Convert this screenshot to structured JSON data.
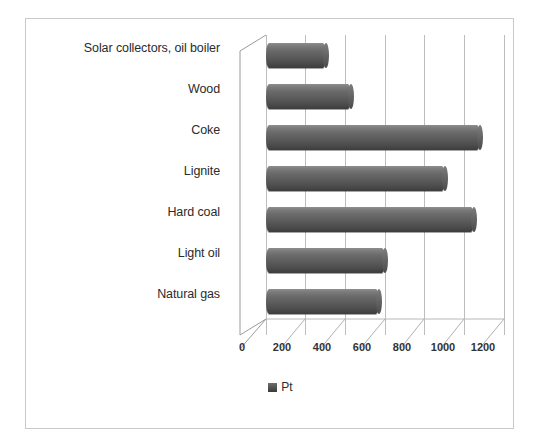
{
  "chart_data": {
    "type": "bar",
    "orientation": "horizontal",
    "style": "3d-cylinder",
    "title": "",
    "xlabel": "",
    "ylabel": "",
    "categories": [
      "Solar collectors, oil boiler",
      "Wood",
      "Coke",
      "Lignite",
      "Hard coal",
      "Light oil",
      "Natural gas"
    ],
    "series": [
      {
        "name": "Pt",
        "values": [
          300,
          430,
          1080,
          900,
          1050,
          600,
          570
        ],
        "color": "#5c5c5c"
      }
    ],
    "xlim": [
      0,
      1200
    ],
    "xticks": [
      0,
      200,
      400,
      600,
      800,
      1000,
      1200
    ],
    "xtick_labels": [
      "0",
      "200",
      "400",
      "600",
      "800",
      "1000",
      "1200"
    ],
    "grid": true,
    "grid_axis": "x",
    "legend": {
      "position": "bottom",
      "entries": [
        {
          "label": "Pt",
          "marker": "filled-square",
          "color": "#4a4a4a"
        }
      ]
    },
    "frame": {
      "border_color": "#c9c9c9",
      "background": "#ffffff"
    }
  }
}
